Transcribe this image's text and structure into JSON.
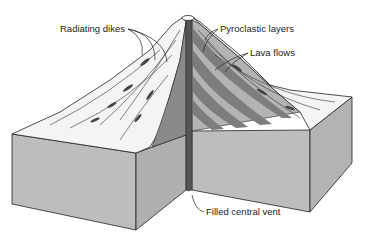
{
  "diagram": {
    "labels": {
      "radiating_dikes": "Radiating dikes",
      "pyroclastic_layers": "Pyroclastic layers",
      "lava_flows": "Lava flows",
      "filled_central_vent": "Filled central vent"
    },
    "colors": {
      "block_front": "#bdbdbd",
      "block_side": "#a9a9a9",
      "inner_wall": "#8a8a8a",
      "layer_dark": "#7d7d7d",
      "layer_light": "#b3b3b3",
      "vent": "#555555",
      "outline": "#222222"
    }
  }
}
